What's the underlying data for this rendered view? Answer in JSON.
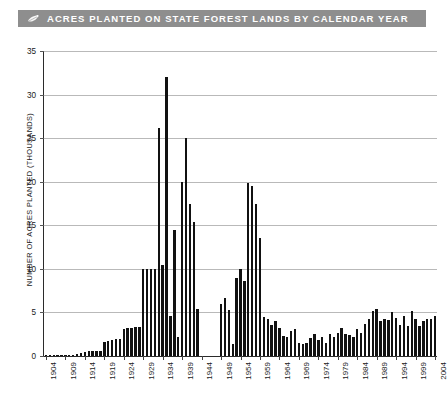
{
  "header": {
    "title": "ACRES PLANTED ON STATE FOREST LANDS BY CALENDAR YEAR",
    "icon": "leaf-sprout-icon",
    "bar_color": "#8e8e8e",
    "text_color": "#ffffff"
  },
  "chart_data": {
    "type": "bar",
    "title": "ACRES PLANTED ON STATE FOREST LANDS BY CALENDAR YEAR",
    "xlabel": "",
    "ylabel": "NUMBER OF ACRES PLANTED (THOUSANDS)",
    "ylim": [
      0,
      35
    ],
    "yticks": [
      0,
      5,
      10,
      15,
      20,
      25,
      30,
      35
    ],
    "xticks": [
      1904,
      1909,
      1914,
      1919,
      1924,
      1929,
      1934,
      1939,
      1944,
      1949,
      1954,
      1959,
      1964,
      1969,
      1974,
      1979,
      1984,
      1989,
      1994,
      1999,
      2004
    ],
    "grid": true,
    "legend": false,
    "bar_color": "#111111",
    "categories": [
      1904,
      1905,
      1906,
      1907,
      1908,
      1909,
      1910,
      1911,
      1912,
      1913,
      1914,
      1915,
      1916,
      1917,
      1918,
      1919,
      1920,
      1921,
      1922,
      1923,
      1924,
      1925,
      1926,
      1927,
      1928,
      1929,
      1930,
      1931,
      1932,
      1933,
      1934,
      1935,
      1936,
      1937,
      1938,
      1939,
      1940,
      1941,
      1942,
      1943,
      1944,
      1945,
      1946,
      1947,
      1948,
      1949,
      1950,
      1951,
      1952,
      1953,
      1954,
      1955,
      1956,
      1957,
      1958,
      1959,
      1960,
      1961,
      1962,
      1963,
      1964,
      1965,
      1966,
      1967,
      1968,
      1969,
      1970,
      1971,
      1972,
      1973,
      1974,
      1975,
      1976,
      1977,
      1978,
      1979,
      1980,
      1981,
      1982,
      1983,
      1984,
      1985,
      1986,
      1987,
      1988,
      1989,
      1990,
      1991,
      1992,
      1993,
      1994,
      1995,
      1996,
      1997,
      1998,
      1999,
      2000,
      2001,
      2002,
      2003,
      2004
    ],
    "values": [
      0.05,
      0.05,
      0.05,
      0.05,
      0.05,
      0.1,
      0.1,
      0.15,
      0.2,
      0.3,
      0.5,
      0.6,
      0.6,
      0.6,
      0.6,
      1.6,
      1.7,
      1.8,
      1.9,
      2.0,
      3.1,
      3.2,
      3.2,
      3.3,
      3.3,
      10.0,
      10.0,
      10.0,
      10.0,
      26.2,
      10.4,
      32.0,
      4.6,
      14.5,
      2.2,
      20.0,
      25.0,
      17.5,
      15.4,
      5.4,
      0,
      0,
      0,
      0,
      0,
      6.0,
      6.7,
      5.3,
      1.4,
      9.0,
      10.0,
      8.6,
      19.8,
      19.5,
      17.5,
      13.6,
      4.5,
      4.2,
      3.6,
      4.0,
      3.2,
      2.3,
      2.2,
      2.9,
      3.1,
      1.5,
      1.4,
      1.5,
      2.1,
      2.5,
      1.8,
      2.2,
      1.5,
      2.5,
      2.2,
      2.6,
      3.2,
      2.5,
      2.4,
      2.2,
      3.1,
      2.6,
      3.7,
      4.3,
      5.2,
      5.4,
      4.0,
      4.3,
      4.1,
      5.0,
      4.4,
      3.6,
      4.6,
      3.5,
      5.2,
      4.2,
      3.4,
      4.0,
      4.2,
      4.3,
      4.6
    ]
  }
}
